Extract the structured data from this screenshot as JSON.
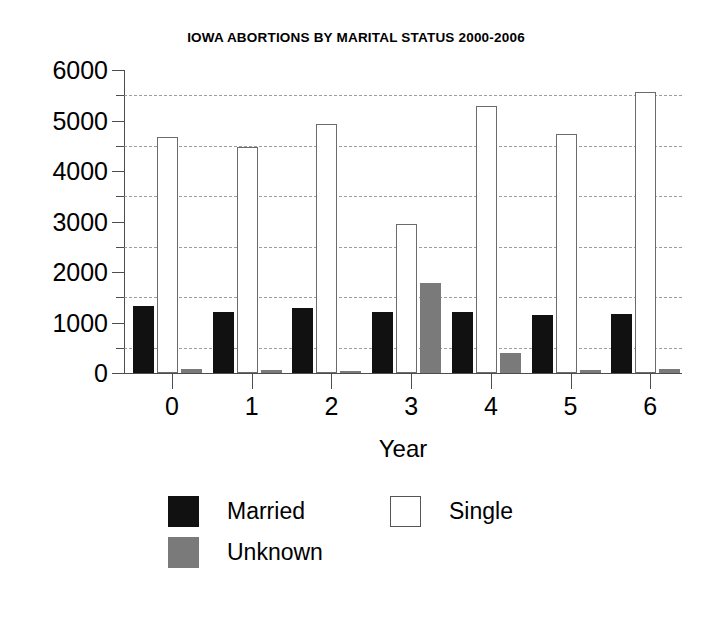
{
  "chart_data": {
    "type": "bar",
    "title": "IOWA ABORTIONS BY MARITAL STATUS 2000-2006",
    "xlabel": "Year",
    "ylabel": "",
    "categories": [
      "0",
      "1",
      "2",
      "3",
      "4",
      "5",
      "6"
    ],
    "ylim": [
      0,
      6000
    ],
    "ytick_labels": [
      "0",
      "1000",
      "2000",
      "3000",
      "4000",
      "5000",
      "6000"
    ],
    "ytick_values": [
      0,
      1000,
      2000,
      3000,
      4000,
      5000,
      6000
    ],
    "minor_tick_values": [
      500,
      1500,
      2500,
      3500,
      4500,
      5500
    ],
    "grid": "dashed horizontal gridlines at minor ticks",
    "legend_position": "below plot",
    "series": [
      {
        "name": "Married",
        "color": "#111111",
        "values": [
          1320,
          1200,
          1290,
          1210,
          1200,
          1140,
          1170
        ]
      },
      {
        "name": "Single",
        "color": "#ffffff",
        "values": [
          4680,
          4480,
          4930,
          2960,
          5280,
          4740,
          5560
        ]
      },
      {
        "name": "Unknown",
        "color": "#7a7a7a",
        "values": [
          70,
          50,
          40,
          1790,
          400,
          60,
          70
        ]
      }
    ]
  },
  "legend": {
    "entries": [
      {
        "label": "Married",
        "swatch": "married"
      },
      {
        "label": "Single",
        "swatch": "single"
      },
      {
        "label": "Unknown",
        "swatch": "unknown"
      }
    ]
  }
}
